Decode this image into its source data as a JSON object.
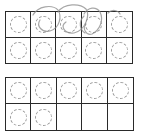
{
  "worksheet": {
    "type": "ten-frames",
    "frames": [
      {
        "id": "top",
        "rows": 2,
        "columns": 5,
        "counters": [
          true,
          true,
          true,
          true,
          true,
          true,
          true,
          true,
          true,
          true
        ],
        "counter_count": 10,
        "has_pencil_marks": true
      },
      {
        "id": "bottom",
        "rows": 2,
        "columns": 5,
        "counters": [
          true,
          true,
          true,
          true,
          true,
          true,
          true,
          false,
          false,
          false
        ],
        "counter_count": 7,
        "has_pencil_marks": false
      }
    ],
    "colors": {
      "grid_line": "#2a2a2a",
      "counter_outline": "#9a9a9a",
      "pencil": "#8a8a8a",
      "background": "#ffffff"
    }
  }
}
